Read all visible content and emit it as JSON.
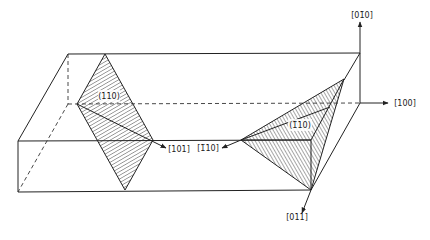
{
  "figure": {
    "type": "crystallographic-diagram"
  },
  "planes": [
    {
      "id": "plane-110",
      "label": "(110)",
      "hatched": true
    },
    {
      "id": "plane-1bar10",
      "label": "(1̄10)",
      "hatched": true
    }
  ],
  "directions": [
    {
      "id": "dir-0bar10",
      "label": "[01̄0]"
    },
    {
      "id": "dir-100",
      "label": "[100]"
    },
    {
      "id": "dir-101",
      "label": "[101]"
    },
    {
      "id": "dir-1bar10",
      "label": "[1̄10]"
    },
    {
      "id": "dir-011",
      "label": "[011]"
    }
  ],
  "colors": {
    "ink": "#222222",
    "background": "#ffffff"
  }
}
